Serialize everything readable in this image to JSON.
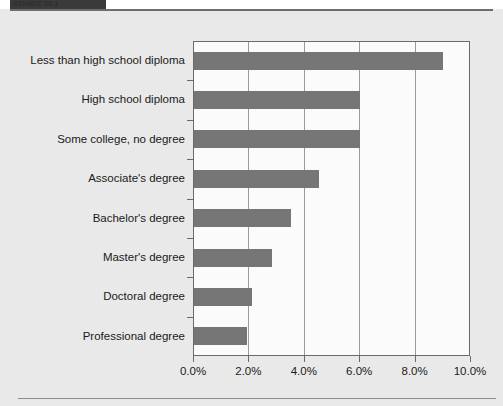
{
  "header": {
    "tab_label": "EXHIBIT 10.1",
    "tab_color": "#3a3a3a"
  },
  "colors": {
    "bar": "#767676",
    "plot_background": "#fbfbfb",
    "page_background": "#e9e9e9",
    "axis": "#6a6a6a",
    "gridline": "#9a9a9a",
    "text": "#1a1a1a"
  },
  "chart_data": {
    "type": "bar",
    "orientation": "horizontal",
    "title": "",
    "subtitle": "",
    "xlabel": "",
    "ylabel": "",
    "xlim": [
      0,
      10
    ],
    "xticks": [
      0,
      2,
      4,
      6,
      8,
      10
    ],
    "xtick_labels": [
      "0.0%",
      "2.0%",
      "4.0%",
      "6.0%",
      "8.0%",
      "10.0%"
    ],
    "grid": true,
    "grid_axis": "x",
    "legend": false,
    "value_unit": "percent",
    "categories": [
      "Less than high school diploma",
      "High school diploma",
      "Some college, no degree",
      "Associate's degree",
      "Bachelor's degree",
      "Master's degree",
      "Doctoral degree",
      "Professional degree"
    ],
    "values": [
      9.0,
      6.0,
      6.0,
      4.5,
      3.5,
      2.8,
      2.1,
      1.9
    ],
    "series": [
      {
        "name": "Unemployment rate",
        "values": [
          9.0,
          6.0,
          6.0,
          4.5,
          3.5,
          2.8,
          2.1,
          1.9
        ]
      }
    ]
  }
}
